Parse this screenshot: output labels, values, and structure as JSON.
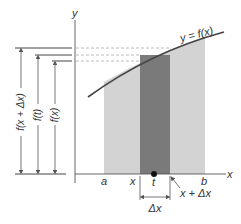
{
  "diagram": {
    "curve_label": "y = f(x)",
    "axes": {
      "x_label": "x",
      "y_label": "y"
    },
    "x_ticks": {
      "a": "a",
      "x": "x",
      "t": "t",
      "x_plus_dx": "x + Δx",
      "b": "b"
    },
    "interval_label": "Δx",
    "height_labels": {
      "f_x_plus_dx": "f(x + Δx)",
      "f_t": "f(t)",
      "f_x": "f(x)"
    },
    "colors": {
      "light_region": "#d3d3d3",
      "dark_region": "#7a7a7a",
      "axis": "#555555",
      "curve": "#444444",
      "dashed": "#aaaaaa"
    }
  }
}
